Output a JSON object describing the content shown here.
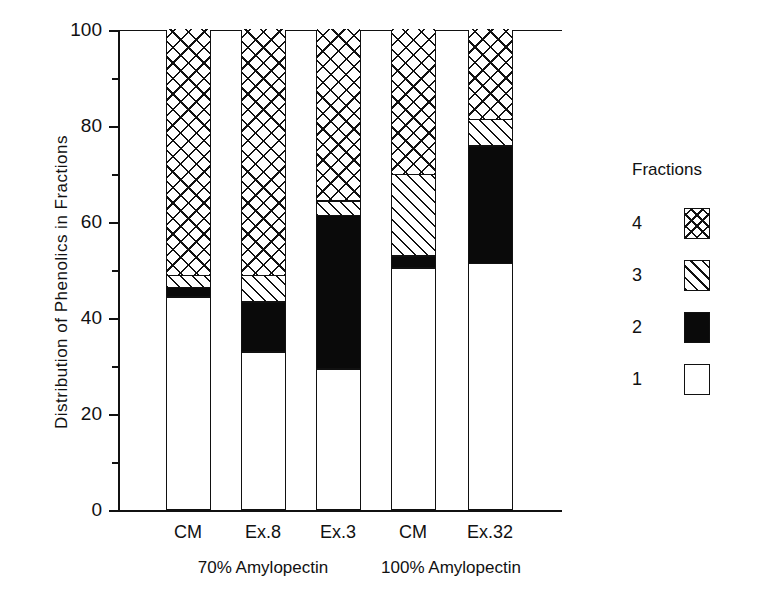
{
  "chart_data": {
    "type": "bar",
    "subtype": "stacked-bar",
    "title": "",
    "xlabel": "",
    "ylabel": "Distribution of Phenolics in Fractions",
    "ylim": [
      0,
      100
    ],
    "y_major_ticks": [
      0,
      20,
      40,
      60,
      80,
      100
    ],
    "y_minor_ticks": [
      10,
      30,
      50,
      70,
      90
    ],
    "grid": false,
    "legend_title": "Fractions",
    "legend_position": "right",
    "legend_entries": [
      {
        "label": "4",
        "pattern": "crosshatch"
      },
      {
        "label": "3",
        "pattern": "diagonal-hatch"
      },
      {
        "label": "2",
        "pattern": "solid-black"
      },
      {
        "label": "1",
        "pattern": "white"
      }
    ],
    "categories": [
      "CM",
      "Ex.8",
      "Ex.3",
      "CM",
      "Ex.32"
    ],
    "groups": [
      {
        "label": "70% Amylopectin",
        "categories": [
          "CM",
          "Ex.8",
          "Ex.3"
        ]
      },
      {
        "label": "100% Amylopectin",
        "categories": [
          "CM",
          "Ex.32"
        ]
      }
    ],
    "series": [
      {
        "name": "1",
        "values": [
          44,
          32.5,
          29,
          50,
          51
        ]
      },
      {
        "name": "2",
        "values": [
          2,
          10.5,
          32,
          2.5,
          24.5
        ]
      },
      {
        "name": "3",
        "values": [
          2.5,
          5.5,
          3,
          17,
          5.5
        ]
      },
      {
        "name": "4",
        "values": [
          51.5,
          51.5,
          36,
          30.5,
          19
        ]
      }
    ],
    "cumulative": [
      {
        "category": "CM",
        "group": "70% Amylopectin",
        "f1": 44,
        "f2": 46,
        "f3": 48.5,
        "f4": 100
      },
      {
        "category": "Ex.8",
        "group": "70% Amylopectin",
        "f1": 32.5,
        "f2": 43,
        "f3": 48.5,
        "f4": 100
      },
      {
        "category": "Ex.3",
        "group": "70% Amylopectin",
        "f1": 29,
        "f2": 61,
        "f3": 64,
        "f4": 100
      },
      {
        "category": "CM",
        "group": "100% Amylopectin",
        "f1": 50,
        "f2": 52.5,
        "f3": 69.5,
        "f4": 100
      },
      {
        "category": "Ex.32",
        "group": "100% Amylopectin",
        "f1": 51,
        "f2": 75.5,
        "f3": 81,
        "f4": 100
      }
    ]
  },
  "axis": {
    "y_tick_labels": [
      "100",
      "80",
      "60",
      "40",
      "20",
      "0"
    ],
    "y_title": "Distribution of Phenolics in Fractions"
  },
  "xaxis": {
    "ticks": [
      {
        "label": "CM"
      },
      {
        "label": "Ex.8"
      },
      {
        "label": "Ex.3"
      },
      {
        "label": "CM"
      },
      {
        "label": "Ex.32"
      }
    ],
    "groups": [
      {
        "label": "70% Amylopectin"
      },
      {
        "label": "100% Amylopectin"
      }
    ]
  },
  "legend": {
    "title": "Fractions",
    "items": [
      {
        "label": "4"
      },
      {
        "label": "3"
      },
      {
        "label": "2"
      },
      {
        "label": "1"
      }
    ]
  },
  "colors": {
    "ink": "#111111",
    "background": "#ffffff",
    "fraction_2_fill": "#0a0a0a"
  }
}
